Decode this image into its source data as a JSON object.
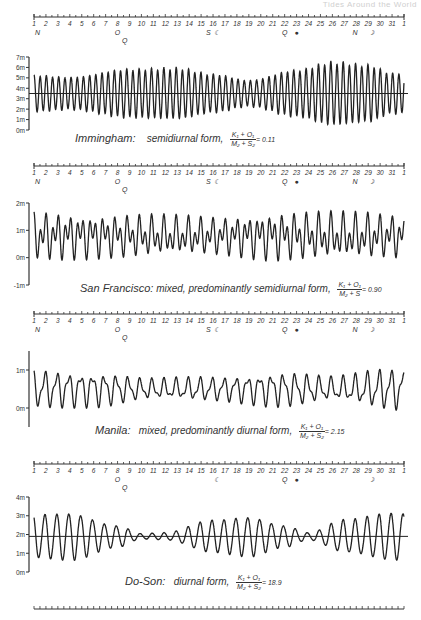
{
  "header": {
    "text": "Tides Around the World"
  },
  "scale": {
    "days": [
      "1",
      "2",
      "3",
      "4",
      "5",
      "6",
      "7",
      "8",
      "9",
      "10",
      "11",
      "12",
      "13",
      "14",
      "15",
      "16",
      "17",
      "18",
      "19",
      "20",
      "21",
      "22",
      "23",
      "24",
      "25",
      "26",
      "27",
      "28",
      "29",
      "30",
      "31",
      "1"
    ],
    "symbols_full": [
      {
        "label": "N",
        "day": 1.3,
        "row": 0
      },
      {
        "label": "O",
        "day": 8,
        "row": 0
      },
      {
        "label": "Q",
        "day": 8.6,
        "row": 1
      },
      {
        "label": "S",
        "day": 15.6,
        "row": 0
      },
      {
        "label": "☾",
        "day": 16.3,
        "row": 0
      },
      {
        "label": "Q",
        "day": 22,
        "row": 0
      },
      {
        "label": "●",
        "day": 23,
        "row": 0
      },
      {
        "label": "N",
        "day": 27.9,
        "row": 0
      },
      {
        "label": "☽",
        "day": 29.2,
        "row": 0
      }
    ],
    "symbols_last": [
      {
        "label": "O",
        "day": 8,
        "row": 0
      },
      {
        "label": "Q",
        "day": 8.6,
        "row": 1
      },
      {
        "label": "☾",
        "day": 16.3,
        "row": 0
      },
      {
        "label": "Q",
        "day": 22,
        "row": 0
      },
      {
        "label": "●",
        "day": 23,
        "row": 0
      },
      {
        "label": "☽",
        "day": 29.2,
        "row": 0
      }
    ]
  },
  "chart_data": [
    {
      "type": "line",
      "title": "Immingham: semidiurnal form, (K1+O1)/(M2+S2) = 0.11",
      "station": "Immingham:",
      "form": "semidiurnal form,",
      "ratio_num": "K₁ + O₁",
      "ratio_den": "M₂ + S₂",
      "ratio_value": "= 0.11",
      "xlabel": "Day of month",
      "ylabel": "Water level (m)",
      "yticks": [
        "0m",
        "1m",
        "2m",
        "3m",
        "4m",
        "5m",
        "6m",
        "7m"
      ],
      "ylim": [
        0,
        7
      ],
      "mean_level": 3.5,
      "has_mean_line": true,
      "constituents": {
        "semi": 1,
        "diurnal": 0.05
      },
      "amplitude_envelope_days": [
        1,
        4,
        9,
        13,
        16,
        19,
        23,
        26,
        29,
        31
      ],
      "amplitude_envelope_m": [
        1.8,
        1.6,
        2.4,
        2.5,
        1.9,
        1.3,
        2.3,
        3.1,
        2.8,
        2.0
      ]
    },
    {
      "type": "line",
      "title": "San Francisco: mixed, predominantly semidiurnal form, (K1+O1)/(M2+S2) = 0.90",
      "station": "San Francisco:",
      "form": "mixed, predominantly semidiurnal form,",
      "ratio_num": "K₁ + O₁",
      "ratio_den": "M₂ + S",
      "ratio_value": "= 0.90",
      "xlabel": "Day of month",
      "ylabel": "Water level (m)",
      "yticks": [
        "-1m",
        "0m",
        "1m",
        "2m"
      ],
      "ylim": [
        -1,
        2
      ],
      "mean_level": 0.8,
      "has_mean_line": false,
      "constituents": {
        "semi": 0.55,
        "diurnal": 0.45
      },
      "amplitude_envelope_days": [
        1,
        8,
        16,
        22,
        29,
        31
      ],
      "amplitude_envelope_m": [
        0.95,
        0.85,
        0.75,
        0.95,
        0.9,
        0.85
      ]
    },
    {
      "type": "line",
      "title": "Manila: mixed, predominantly diurnal form, (K1+O1)/(M2+S2) = 2.15",
      "station": "Manila:",
      "form": "mixed, predominantly diurnal form,",
      "ratio_num": "K₁ + O₁",
      "ratio_den": "M₂ + S₂",
      "ratio_value": "= 2.15",
      "xlabel": "Day of month",
      "ylabel": "Water level (m)",
      "yticks": [
        "0m",
        "1m"
      ],
      "ylim": [
        -0.5,
        1.5
      ],
      "mean_level": 0.5,
      "has_mean_line": false,
      "constituents": {
        "semi": 0.3,
        "diurnal": 0.7
      },
      "amplitude_envelope_days": [
        1,
        6,
        11,
        16,
        22,
        26,
        31
      ],
      "amplitude_envelope_m": [
        0.55,
        0.5,
        0.3,
        0.35,
        0.5,
        0.35,
        0.6
      ]
    },
    {
      "type": "line",
      "title": "Do-Son: diurnal form, (K1+O1)/(M2+S2) = 18.9",
      "station": "Do-Son:",
      "form": "diurnal form,",
      "ratio_num": "K₁ + O₁",
      "ratio_den": "M₂ + S₂",
      "ratio_value": "= 18.9",
      "xlabel": "Day of month",
      "ylabel": "Water level (m)",
      "yticks": [
        "0m",
        "1m",
        "2m",
        "3m",
        "4m"
      ],
      "ylim": [
        0,
        4
      ],
      "mean_level": 1.9,
      "has_mean_line": true,
      "constituents": {
        "semi": 0.05,
        "diurnal": 0.95
      },
      "amplitude_envelope_days": [
        1,
        4,
        8,
        10,
        12,
        16,
        19,
        22,
        24,
        27,
        31
      ],
      "amplitude_envelope_m": [
        1.2,
        1.3,
        0.6,
        0.15,
        0.2,
        0.9,
        1.1,
        0.6,
        0.2,
        0.9,
        1.3
      ]
    }
  ]
}
